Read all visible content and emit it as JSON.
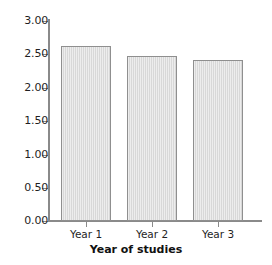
{
  "chart_data": {
    "type": "bar",
    "title": "",
    "subtitle": "",
    "xlabel": "Year of studies",
    "ylabel": "",
    "categories": [
      "Year 1",
      "Year 2",
      "Year 3"
    ],
    "values": [
      2.62,
      2.48,
      2.42
    ],
    "series": [
      {
        "name": "",
        "values": [
          2.62,
          2.48,
          2.42
        ]
      }
    ],
    "ylim": [
      0.0,
      3.0
    ],
    "ytick_labels": [
      "3.00",
      "2.50",
      "2.00",
      "1.50",
      "1.00",
      "0.50",
      "0.00"
    ],
    "ytick_values": [
      3.0,
      2.5,
      2.0,
      1.5,
      1.0,
      0.5,
      0.0
    ],
    "ytick_step": 0.5,
    "grid": false,
    "legend": false,
    "legend_position": "none",
    "bar_fill_color": "#d8d8d8",
    "bar_border_color": "#8f8f8f",
    "axis_color": "#8a8a8a",
    "background_color": "#ffffff",
    "text_color": "#1f1f1f"
  }
}
